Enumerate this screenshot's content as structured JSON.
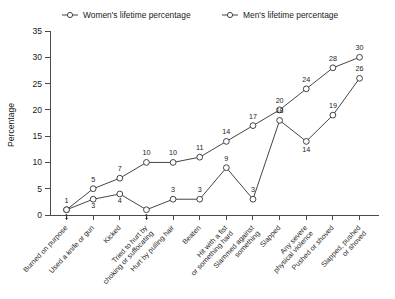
{
  "chart_data": {
    "type": "line",
    "title": "",
    "xlabel": "",
    "ylabel": "Percentage",
    "ylim": [
      0,
      35
    ],
    "yticks": [
      0,
      5,
      10,
      15,
      20,
      25,
      30,
      35
    ],
    "grid": false,
    "legend_position": "top",
    "categories": [
      "Burned on purpose",
      "Used a knife or gun",
      "Kicked",
      "Tried to hurt by choking or suffocating",
      "Hurt by pulling hair",
      "Beaten",
      "Hit with a fist or something hard",
      "Slammed against something",
      "Slapped",
      "Any severe physical violence",
      "Pushed or shoved",
      "Slapped, pushed or shoved"
    ],
    "series": [
      {
        "name": "Women's lifetime percentage",
        "marker": "open-circle",
        "values": [
          1,
          5,
          7,
          10,
          10,
          11,
          14,
          17,
          20,
          24,
          28,
          30
        ]
      },
      {
        "name": "Men's lifetime percentage",
        "marker": "open-circle",
        "values": [
          1,
          3,
          4,
          1,
          3,
          3,
          9,
          3,
          18,
          14,
          19,
          26
        ]
      }
    ]
  },
  "legend": {
    "items": [
      {
        "label": "Women's lifetime percentage"
      },
      {
        "label": "Men's lifetime percentage"
      }
    ]
  },
  "axes": {
    "y_title": "Percentage"
  },
  "colors": {
    "line": "#303030",
    "axis": "#4a4a4a",
    "text": "#1a1a1a",
    "background": "#ffffff"
  }
}
